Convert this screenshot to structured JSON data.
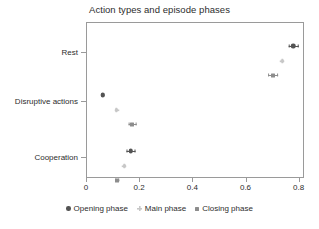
{
  "chart_data": {
    "type": "scatter",
    "title": "Action types and episode phases",
    "xlabel": "",
    "ylabel": "",
    "xlim": [
      0,
      0.82
    ],
    "xticks": [
      0,
      0.2,
      0.4,
      0.6,
      0.8
    ],
    "xtick_labels": [
      "0",
      "0.2",
      "0.4",
      "0.6",
      "0.8"
    ],
    "categories": [
      "Rest",
      "Disruptive actions",
      "Cooperation"
    ],
    "grid": false,
    "legend_position": "bottom-center",
    "orientation": "horizontal",
    "series": [
      {
        "name": "Opening phase",
        "color": "#545454",
        "marker": "circle",
        "values": [
          0.775,
          0.06,
          0.165
        ],
        "err_low": [
          0.757,
          0.055,
          0.15
        ],
        "err_high": [
          0.795,
          0.066,
          0.182
        ]
      },
      {
        "name": "Main phase",
        "color": "#c7c7c7",
        "marker": "plus",
        "values": [
          0.735,
          0.112,
          0.141
        ],
        "err_low": [
          0.729,
          0.107,
          0.135
        ],
        "err_high": [
          0.742,
          0.118,
          0.147
        ]
      },
      {
        "name": "Closing phase",
        "color": "#8d8d8d",
        "marker": "square",
        "values": [
          0.7,
          0.171,
          0.114
        ],
        "err_low": [
          0.681,
          0.155,
          0.108
        ],
        "err_high": [
          0.718,
          0.188,
          0.121
        ]
      }
    ]
  },
  "legend": {
    "items": [
      {
        "label": "Opening phase",
        "color": "#545454",
        "marker": "circle"
      },
      {
        "label": "Main phase",
        "color": "#c7c7c7",
        "marker": "plus"
      },
      {
        "label": "Closing phase",
        "color": "#8d8d8d",
        "marker": "square"
      }
    ]
  }
}
